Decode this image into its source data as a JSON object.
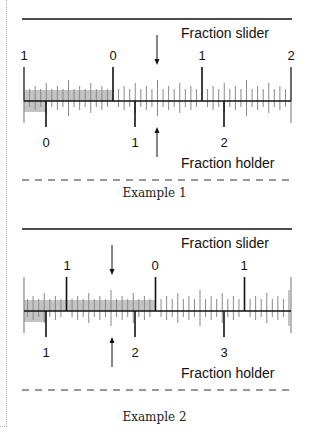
{
  "examples": [
    {
      "caption": "Example 1",
      "slider_label": "Fraction slider",
      "holder_label": "Fraction holder",
      "slider_numbers": [
        {
          "text": "1",
          "x": 24
        },
        {
          "text": "0",
          "x": 113
        },
        {
          "text": "1",
          "x": 202
        },
        {
          "text": "2",
          "x": 291
        }
      ],
      "holder_numbers": [
        {
          "text": "0",
          "x": 46
        },
        {
          "text": "1",
          "x": 135
        },
        {
          "text": "2",
          "x": 224
        }
      ],
      "slider_zero_x": 113,
      "holder_zero_x": 46,
      "arrow_x": 157,
      "shade_slider": [
        24,
        113
      ],
      "shade_holder": [
        24,
        46
      ]
    },
    {
      "caption": "Example 2",
      "slider_label": "Fraction slider",
      "holder_label": "Fraction holder",
      "slider_numbers": [
        {
          "text": "1",
          "x": 67
        },
        {
          "text": "0",
          "x": 155
        },
        {
          "text": "1",
          "x": 244
        }
      ],
      "holder_numbers": [
        {
          "text": "1",
          "x": 46
        },
        {
          "text": "2",
          "x": 135
        },
        {
          "text": "3",
          "x": 224
        }
      ],
      "slider_zero_x": 155.5,
      "holder_zero_x": -43,
      "arrow_x": 112,
      "shade_slider": [
        24,
        155
      ],
      "shade_holder": [
        24,
        46
      ]
    }
  ],
  "scale": {
    "unit_px": 89,
    "subdivisions": 16,
    "ruler_left": 24,
    "ruler_right": 291
  },
  "colors": {
    "ink": "#111111",
    "tick": "#888888",
    "shade": "#c4c4c4"
  }
}
